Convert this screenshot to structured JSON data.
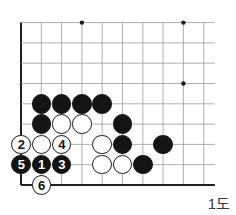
{
  "figure": {
    "label": "1도",
    "board": {
      "grid_spacing": 20.3,
      "origin_x": 21,
      "bottom_y": 185,
      "cols": 10,
      "rows": 9,
      "line_color": "#9a9a9a",
      "edge_color": "#1f1f1f",
      "star_color": "#1a1a1a",
      "star_points": [
        {
          "col": 3,
          "row_from_top": 0
        },
        {
          "col": 8,
          "row_from_top": 0
        },
        {
          "col": 8,
          "row_from_top": 3
        }
      ]
    },
    "stones": [
      {
        "id": "b-c6",
        "color": "black",
        "col": 1,
        "row_from_bottom": 5,
        "number": ""
      },
      {
        "id": "b-d6",
        "color": "black",
        "col": 2,
        "row_from_bottom": 5,
        "number": ""
      },
      {
        "id": "b-e6",
        "color": "black",
        "col": 3,
        "row_from_bottom": 5,
        "number": ""
      },
      {
        "id": "b-f6",
        "color": "black",
        "col": 4,
        "row_from_bottom": 5,
        "number": ""
      },
      {
        "id": "b-c5",
        "color": "black",
        "col": 1,
        "row_from_bottom": 4,
        "number": ""
      },
      {
        "id": "w-d5",
        "color": "white",
        "col": 2,
        "row_from_bottom": 4,
        "number": ""
      },
      {
        "id": "w-e5",
        "color": "white",
        "col": 3,
        "row_from_bottom": 4,
        "number": ""
      },
      {
        "id": "b-g5",
        "color": "black",
        "col": 5,
        "row_from_bottom": 4,
        "number": ""
      },
      {
        "id": "w-f4",
        "color": "white",
        "col": 4,
        "row_from_bottom": 3,
        "number": ""
      },
      {
        "id": "b-g4",
        "color": "black",
        "col": 5,
        "row_from_bottom": 3,
        "number": ""
      },
      {
        "id": "b-i4",
        "color": "black",
        "col": 7,
        "row_from_bottom": 3,
        "number": ""
      },
      {
        "id": "w-f3",
        "color": "white",
        "col": 4,
        "row_from_bottom": 2,
        "number": ""
      },
      {
        "id": "w-g3",
        "color": "white",
        "col": 5,
        "row_from_bottom": 2,
        "number": ""
      },
      {
        "id": "b-h3",
        "color": "black",
        "col": 6,
        "row_from_bottom": 2,
        "number": ""
      },
      {
        "id": "move-2",
        "color": "white",
        "col": 0,
        "row_from_bottom": 3,
        "number": "2"
      },
      {
        "id": "w-d4",
        "color": "white",
        "col": 1,
        "row_from_bottom": 3,
        "number": ""
      },
      {
        "id": "move-4",
        "color": "white",
        "col": 2,
        "row_from_bottom": 3,
        "number": "4"
      },
      {
        "id": "move-5",
        "color": "black",
        "col": 0,
        "row_from_bottom": 2,
        "number": "5"
      },
      {
        "id": "move-1",
        "color": "black",
        "col": 1,
        "row_from_bottom": 2,
        "number": "1"
      },
      {
        "id": "move-3",
        "color": "black",
        "col": 2,
        "row_from_bottom": 2,
        "number": "3"
      },
      {
        "id": "move-6",
        "color": "white",
        "col": 1,
        "row_from_bottom": 1,
        "number": "6"
      }
    ]
  }
}
